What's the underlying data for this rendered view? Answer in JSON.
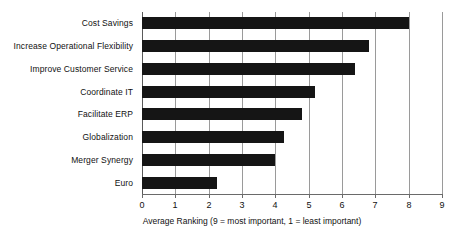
{
  "chart_data": {
    "type": "bar",
    "orientation": "horizontal",
    "title": "",
    "xlabel": "Average Ranking (9 = most important, 1 = least important)",
    "ylabel": "",
    "xlim": [
      0,
      9
    ],
    "xticks": [
      "0",
      "1",
      "2",
      "3",
      "4",
      "5",
      "6",
      "7",
      "8",
      "9"
    ],
    "grid": true,
    "grid_axis": "x",
    "legend": false,
    "bar_color": "#151515",
    "categories": [
      "Cost Savings",
      "Increase Operational Flexibility",
      "Improve Customer Service",
      "Coordinate IT",
      "Facilitate ERP",
      "Globalization",
      "Merger Synergy",
      "Euro"
    ],
    "values": [
      8.0,
      6.8,
      6.4,
      5.2,
      4.8,
      4.25,
      4.0,
      2.25
    ]
  }
}
